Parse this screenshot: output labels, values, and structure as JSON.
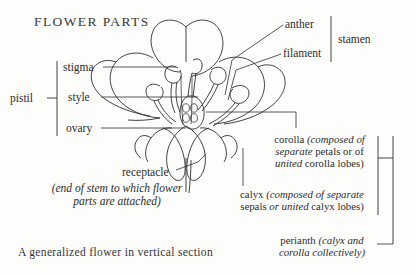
{
  "figure": {
    "title": "FLOWER  PARTS",
    "caption": "A generalized flower in vertical section",
    "subject": "generalized flower in vertical section",
    "line_color": "#2e2e2e",
    "background_color": "#fdfdfb",
    "text_color": "#2d2d2d"
  },
  "labels": {
    "pistil": "pistil",
    "stigma": "stigma",
    "style": "style",
    "ovary": "ovary",
    "receptacle": "receptacle",
    "receptacle_note_line1": "(end of stem to which flower",
    "receptacle_note_line2": "parts are attached)",
    "anther": "anther",
    "filament": "filament",
    "stamen": "stamen",
    "corolla_name": "corolla ",
    "corolla_note_a": "(composed of",
    "corolla_note_b": "separate",
    "corolla_note_c": " petals or of",
    "corolla_note_d": "united",
    "corolla_note_e": " corolla lobes)",
    "calyx_name": "calyx ",
    "calyx_note_a": "(composed of separate",
    "calyx_note_b": "sepals ",
    "calyx_note_c": "or ",
    "calyx_note_d": "united",
    "calyx_note_e": " calyx lobes)",
    "perianth_name": "perianth ",
    "perianth_note_a": "(calyx and",
    "perianth_note_b": "corolla collectively)"
  },
  "groups": {
    "pistil_members": [
      "stigma",
      "style",
      "ovary"
    ],
    "stamen_members": [
      "anther",
      "filament"
    ],
    "perianth_members": [
      "corolla",
      "calyx"
    ]
  }
}
